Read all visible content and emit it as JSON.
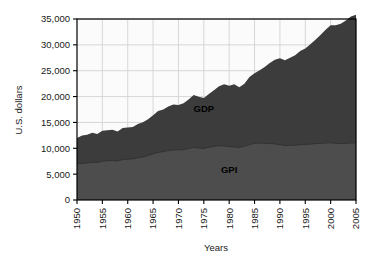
{
  "chart_data": {
    "type": "area",
    "title": "",
    "subtitle": "",
    "xlabel": "Years",
    "ylabel": "U.S. dollars",
    "xlim": [
      1950,
      2005
    ],
    "ylim": [
      0,
      35000
    ],
    "grid": true,
    "stacked": true,
    "legend_position": "inline-labels",
    "x_ticks": [
      "1950",
      "1955",
      "1960",
      "1965",
      "1970",
      "1975",
      "1980",
      "1985",
      "1990",
      "1995",
      "2000",
      "2005"
    ],
    "y_ticks": [
      "0",
      "5,000",
      "10,000",
      "15,000",
      "20,000",
      "25,000",
      "30,000",
      "35,000"
    ],
    "y_tick_values": [
      0,
      5000,
      10000,
      15000,
      20000,
      25000,
      30000,
      35000
    ],
    "x": [
      1950,
      1951,
      1952,
      1953,
      1954,
      1955,
      1956,
      1957,
      1958,
      1959,
      1960,
      1961,
      1962,
      1963,
      1964,
      1965,
      1966,
      1967,
      1968,
      1969,
      1970,
      1971,
      1972,
      1973,
      1974,
      1975,
      1976,
      1977,
      1978,
      1979,
      1980,
      1981,
      1982,
      1983,
      1984,
      1985,
      1986,
      1987,
      1988,
      1989,
      1990,
      1991,
      1992,
      1993,
      1994,
      1995,
      1996,
      1997,
      1998,
      1999,
      2000,
      2001,
      2002,
      2003,
      2004,
      2005
    ],
    "series": [
      {
        "name": "GPI",
        "label": "GPI",
        "color": "#4a4a4a",
        "values": [
          7000,
          7100,
          7150,
          7300,
          7250,
          7500,
          7600,
          7650,
          7550,
          7800,
          7900,
          7950,
          8150,
          8300,
          8600,
          8900,
          9200,
          9350,
          9550,
          9650,
          9700,
          9750,
          9950,
          10150,
          10050,
          9950,
          10200,
          10350,
          10500,
          10450,
          10300,
          10250,
          10150,
          10400,
          10700,
          10950,
          11000,
          10950,
          10900,
          10850,
          10700,
          10500,
          10550,
          10600,
          10700,
          10750,
          10800,
          10900,
          10950,
          11000,
          11050,
          10950,
          10900,
          10950,
          11000,
          11050
        ]
      },
      {
        "name": "GDP",
        "label": "GDP",
        "color": "#3a3a3a",
        "values": [
          12000,
          12450,
          12600,
          13000,
          12750,
          13400,
          13500,
          13600,
          13250,
          13900,
          14000,
          14100,
          14700,
          15050,
          15600,
          16400,
          17200,
          17500,
          18100,
          18450,
          18350,
          18700,
          19450,
          20300,
          19950,
          19700,
          20500,
          21200,
          22000,
          22400,
          22100,
          22400,
          21800,
          22500,
          23800,
          24500,
          25100,
          25700,
          26500,
          27100,
          27400,
          27000,
          27500,
          28000,
          28800,
          29300,
          30100,
          31000,
          31900,
          32900,
          33800,
          33800,
          34100,
          34700,
          35500,
          35800
        ]
      }
    ],
    "annotations": [
      {
        "text": "GDP",
        "x": 1975,
        "y": 17000
      },
      {
        "text": "GPI",
        "x": 1980,
        "y": 5200
      }
    ],
    "colors": {
      "gdp_fill": "#3c3c3c",
      "gpi_fill": "#4d4d4d",
      "plot_background": "#fbfbfb",
      "grid": "#d2d2d2",
      "axis": "#000000",
      "text": "#1a1a1a"
    }
  }
}
